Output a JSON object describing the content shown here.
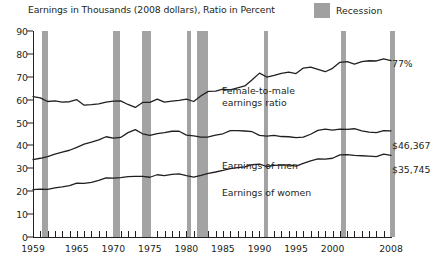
{
  "chart": {
    "title": "Earnings in Thousands (2008 dollars), Ratio in Percent",
    "legend": {
      "swatch_name": "recession-swatch",
      "label": "Recession",
      "color": "#a3a3a3"
    },
    "line_color": "#231f20",
    "annotations": {
      "ratio_line1": "Female-to-male",
      "ratio_line2": "earnings ratio",
      "men": "Earnings of men",
      "women": "Earnings of women"
    },
    "end_labels": {
      "ratio": "77%",
      "men": "$46,367",
      "women": "$35,745"
    }
  },
  "chart_data": {
    "type": "line",
    "title": "Earnings in Thousands (2008 dollars), Ratio in Percent",
    "xlabel": "",
    "ylabel": "",
    "xlim": [
      1959,
      2008
    ],
    "ylim": [
      0,
      90
    ],
    "yticks": [
      0,
      10,
      20,
      30,
      40,
      50,
      60,
      70,
      80,
      90
    ],
    "xticks_labeled": [
      1959,
      1965,
      1970,
      1975,
      1980,
      1985,
      1990,
      1995,
      2000,
      2008
    ],
    "xtick_interval": 1,
    "grid": false,
    "legend_position": "top-right",
    "x": [
      1959,
      1960,
      1961,
      1962,
      1963,
      1964,
      1965,
      1966,
      1967,
      1968,
      1969,
      1970,
      1971,
      1972,
      1973,
      1974,
      1975,
      1976,
      1977,
      1978,
      1979,
      1980,
      1981,
      1982,
      1983,
      1984,
      1985,
      1986,
      1987,
      1988,
      1989,
      1990,
      1991,
      1992,
      1993,
      1994,
      1995,
      1996,
      1997,
      1998,
      1999,
      2000,
      2001,
      2002,
      2003,
      2004,
      2005,
      2006,
      2007,
      2008
    ],
    "series": [
      {
        "name": "Female-to-male earnings ratio",
        "unit": "percent",
        "end_label": "77%",
        "values": [
          61.3,
          60.8,
          59.2,
          59.5,
          58.9,
          59.1,
          60.0,
          57.6,
          57.8,
          58.2,
          58.9,
          59.4,
          59.5,
          57.9,
          56.6,
          58.8,
          58.8,
          60.2,
          58.9,
          59.4,
          59.7,
          60.2,
          59.2,
          61.7,
          63.6,
          63.7,
          64.6,
          64.3,
          65.2,
          66.0,
          68.7,
          71.6,
          69.9,
          70.6,
          71.5,
          72.0,
          71.4,
          73.8,
          74.2,
          73.2,
          72.2,
          73.7,
          76.3,
          76.6,
          75.5,
          76.6,
          77.0,
          76.9,
          77.8,
          77.1
        ]
      },
      {
        "name": "Earnings of men",
        "unit": "thousands of 2008 dollars",
        "end_label": "$46,367",
        "values": [
          33.8,
          34.4,
          35.1,
          36.2,
          37.1,
          37.9,
          39.2,
          40.6,
          41.4,
          42.4,
          43.8,
          43.2,
          43.5,
          45.6,
          46.9,
          45.1,
          44.4,
          45.2,
          45.6,
          46.2,
          46.2,
          44.5,
          44.2,
          43.6,
          43.7,
          44.5,
          45.1,
          46.5,
          46.5,
          46.3,
          46.0,
          44.4,
          44.1,
          44.4,
          43.9,
          43.8,
          43.4,
          43.6,
          44.9,
          46.6,
          47.1,
          46.7,
          47.1,
          47.0,
          47.3,
          46.4,
          45.8,
          45.6,
          46.5,
          46.4
        ]
      },
      {
        "name": "Earnings of women",
        "unit": "thousands of 2008 dollars",
        "end_label": "$35,745",
        "values": [
          20.7,
          20.9,
          20.8,
          21.5,
          21.9,
          22.4,
          23.5,
          23.4,
          23.9,
          24.7,
          25.8,
          25.7,
          25.9,
          26.4,
          26.5,
          26.5,
          26.1,
          27.2,
          26.8,
          27.4,
          27.6,
          26.8,
          26.2,
          26.9,
          27.8,
          28.4,
          29.1,
          29.9,
          30.3,
          30.6,
          31.6,
          31.8,
          30.8,
          31.3,
          31.4,
          31.5,
          31.0,
          32.2,
          33.3,
          34.1,
          34.0,
          34.4,
          35.9,
          36.0,
          35.7,
          35.5,
          35.3,
          35.1,
          36.2,
          35.7
        ]
      }
    ],
    "recessions": [
      {
        "start": 1960.3,
        "end": 1961.1
      },
      {
        "start": 1969.9,
        "end": 1970.9
      },
      {
        "start": 1973.9,
        "end": 1975.2
      },
      {
        "start": 1980.1,
        "end": 1980.5
      },
      {
        "start": 1981.5,
        "end": 1982.9
      },
      {
        "start": 1990.6,
        "end": 1991.2
      },
      {
        "start": 2001.2,
        "end": 2001.9
      },
      {
        "start": 2007.9,
        "end": 2008.6
      }
    ]
  }
}
